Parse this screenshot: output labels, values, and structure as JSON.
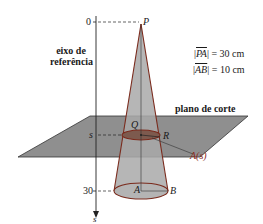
{
  "diagram": {
    "axis_label_line1": "eixo de",
    "axis_label_line2": "referência",
    "axis_variable": "s",
    "tick_zero": "0",
    "tick_s": "s",
    "tick_thirty": "30",
    "point_P": "P",
    "point_Q": "Q",
    "point_R": "R",
    "point_A": "A",
    "point_B": "B",
    "area_label": "A(s)",
    "measure_PA": {
      "segment": "PA",
      "value": "= 30 cm"
    },
    "measure_AB": {
      "segment": "AB",
      "value": "= 10 cm"
    },
    "plane_label": "plano de corte"
  },
  "colors": {
    "plane_fill": "#8f8f8f",
    "cone_fill": "#a9a9a9",
    "cone_edge": "#7a2a1c",
    "section_fill": "#7d5a4e",
    "axis": "#222222"
  }
}
